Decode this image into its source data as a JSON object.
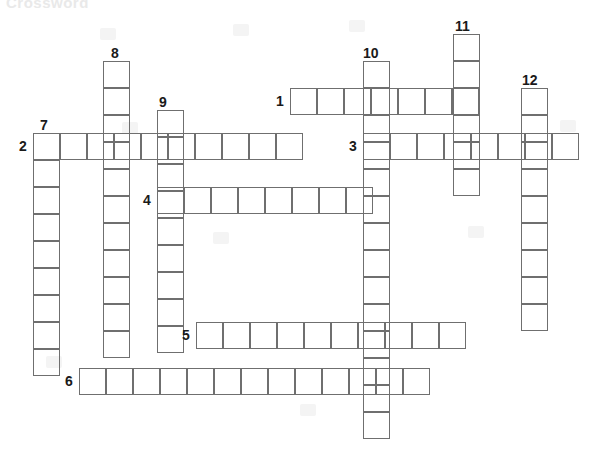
{
  "page": {
    "title": "Crossword",
    "width": 592,
    "height": 453,
    "background_color": "#ffffff",
    "cell_size": 27,
    "grid_line_color": "#6f6f6f",
    "number_color": "#1a1a1a"
  },
  "entries": [
    {
      "number": "1",
      "direction": "across",
      "length": 7,
      "x": 290,
      "y": 88,
      "number_x": 276,
      "number_y": 93,
      "letters": [
        "",
        "",
        "",
        "",
        "",
        "",
        ""
      ]
    },
    {
      "number": "2",
      "direction": "across",
      "length": 10,
      "x": 33,
      "y": 133,
      "number_x": 19,
      "number_y": 138,
      "letters": [
        "",
        "",
        "",
        "",
        "",
        "",
        "",
        "",
        "",
        ""
      ]
    },
    {
      "number": "3",
      "direction": "across",
      "length": 8,
      "x": 363,
      "y": 133,
      "number_x": 349,
      "number_y": 138,
      "letters": [
        "",
        "",
        "",
        "",
        "",
        "",
        "",
        ""
      ]
    },
    {
      "number": "4",
      "direction": "across",
      "length": 8,
      "x": 157,
      "y": 187,
      "number_x": 143,
      "number_y": 192,
      "letters": [
        "",
        "",
        "",
        "",
        "",
        "",
        "",
        ""
      ]
    },
    {
      "number": "5",
      "direction": "across",
      "length": 10,
      "x": 196,
      "y": 322,
      "number_x": 182,
      "number_y": 327,
      "letters": [
        "",
        "",
        "",
        "",
        "",
        "",
        "",
        "",
        "",
        ""
      ]
    },
    {
      "number": "6",
      "direction": "across",
      "length": 13,
      "x": 79,
      "y": 368,
      "number_x": 65,
      "number_y": 373,
      "letters": [
        "",
        "",
        "",
        "",
        "",
        "",
        "",
        "",
        "",
        "",
        "",
        "",
        ""
      ]
    },
    {
      "number": "7",
      "direction": "down",
      "length": 9,
      "x": 33,
      "y": 133,
      "number_x": 40,
      "number_y": 117,
      "letters": [
        "",
        "",
        "",
        "",
        "",
        "",
        "",
        "",
        ""
      ]
    },
    {
      "number": "8",
      "direction": "down",
      "length": 11,
      "x": 103,
      "y": 61,
      "number_x": 111,
      "number_y": 45,
      "letters": [
        "",
        "",
        "",
        "",
        "",
        "",
        "",
        "",
        "",
        "",
        ""
      ]
    },
    {
      "number": "9",
      "direction": "down",
      "length": 9,
      "x": 157,
      "y": 110,
      "number_x": 159,
      "number_y": 94,
      "letters": [
        "",
        "",
        "",
        "",
        "",
        "",
        "",
        "",
        ""
      ]
    },
    {
      "number": "10",
      "direction": "down",
      "length": 14,
      "x": 363,
      "y": 61,
      "number_x": 363,
      "number_y": 45,
      "letters": [
        "",
        "",
        "",
        "",
        "",
        "",
        "",
        "",
        "",
        "",
        "",
        "",
        "",
        ""
      ]
    },
    {
      "number": "11",
      "direction": "down",
      "length": 6,
      "x": 453,
      "y": 34,
      "number_x": 455,
      "number_y": 18,
      "letters": [
        "",
        "",
        "",
        "",
        "",
        ""
      ]
    },
    {
      "number": "12",
      "direction": "down",
      "length": 9,
      "x": 521,
      "y": 88,
      "number_x": 522,
      "number_y": 72,
      "letters": [
        "",
        "",
        "",
        "",
        "",
        "",
        "",
        "",
        ""
      ]
    }
  ],
  "watermarks": [
    {
      "x": 100,
      "y": 28
    },
    {
      "x": 233,
      "y": 24
    },
    {
      "x": 349,
      "y": 20
    },
    {
      "x": 122,
      "y": 122
    },
    {
      "x": 213,
      "y": 232
    },
    {
      "x": 46,
      "y": 356
    },
    {
      "x": 300,
      "y": 404
    },
    {
      "x": 468,
      "y": 226
    },
    {
      "x": 560,
      "y": 120
    }
  ]
}
